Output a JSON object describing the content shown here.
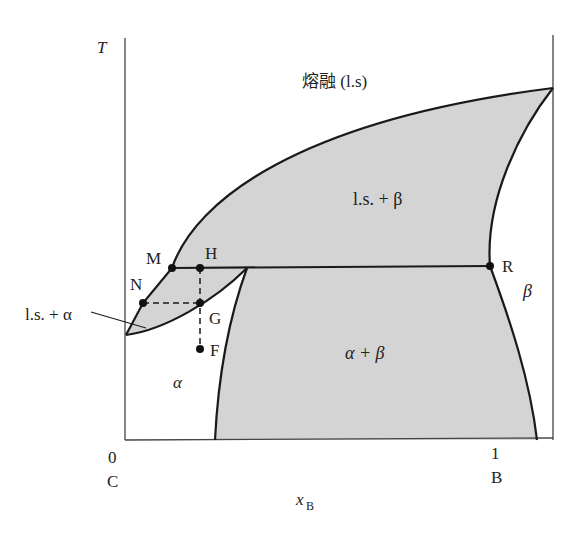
{
  "diagram": {
    "type": "binary phase diagram (eutectic)",
    "axes": {
      "y_label": "T",
      "x_label": "x",
      "x_label_sub": "B",
      "x_left_tick": "0",
      "x_left_component": "C",
      "x_right_tick": "1",
      "x_right_component": "B"
    },
    "regions": {
      "melt": "熔融 (l.s)",
      "ls_beta": "l.s. + β",
      "ls_alpha": "l.s. + α",
      "alpha": "α",
      "beta": "β",
      "alpha_beta": "α + β"
    },
    "points": {
      "M": "M",
      "H": "H",
      "N": "N",
      "G": "G",
      "F": "F",
      "R": "R"
    },
    "colors": {
      "fill": "#d4d4d4",
      "line": "#1a1a1a",
      "axis": "#444444"
    }
  }
}
